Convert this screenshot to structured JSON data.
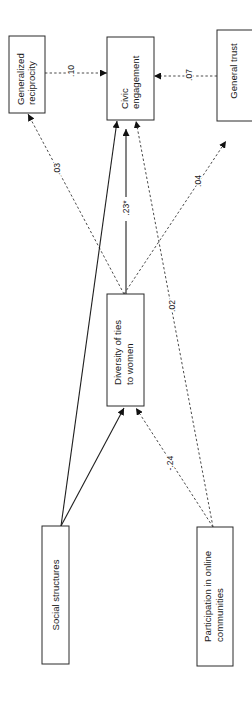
{
  "diagram": {
    "orientation": "rotated 90 degrees counter-clockwise",
    "nodes": {
      "generalized_reciprocity": {
        "lines": [
          "Generalized",
          "reciprocity"
        ]
      },
      "civic_engagement": {
        "lines": [
          "Civic",
          "engagement"
        ]
      },
      "general_trust": {
        "lines": [
          "General trust"
        ]
      },
      "diversity_of_ties": {
        "lines": [
          "Diversity of ties",
          "to women"
        ]
      },
      "social_structures": {
        "lines": [
          "Social structures"
        ]
      },
      "participation": {
        "lines": [
          "Participation in online",
          "communities"
        ]
      }
    },
    "edges": [
      {
        "from": "Generalized reciprocity",
        "to": "Civic engagement",
        "coefficient": ".10",
        "style": "dashed"
      },
      {
        "from": "General trust",
        "to": "Civic engagement",
        "coefficient": ".07",
        "style": "dashed"
      },
      {
        "from": "Diversity of ties to women",
        "to": "Generalized reciprocity",
        "coefficient": ".03",
        "style": "dashed"
      },
      {
        "from": "Diversity of ties to women",
        "to": "Civic engagement",
        "coefficient": ".23*",
        "style": "solid"
      },
      {
        "from": "Diversity of ties to women",
        "to": "General trust",
        "coefficient": ".04",
        "style": "dashed"
      },
      {
        "from": "Social structures",
        "to": "Civic engagement",
        "coefficient": "",
        "style": "solid"
      },
      {
        "from": "Social structures",
        "to": "Diversity of ties to women",
        "coefficient": "",
        "style": "solid"
      },
      {
        "from": "Participation in online communities",
        "to": "Civic engagement",
        "coefficient": ".02",
        "style": "dashed"
      },
      {
        "from": "Participation in online communities",
        "to": "Diversity of ties to women",
        "coefficient": "-.24",
        "style": "dashed"
      }
    ],
    "colors": {
      "line": "#1f1f1f",
      "dashed_line": "#4a4a4a",
      "background": "#ffffff"
    }
  }
}
